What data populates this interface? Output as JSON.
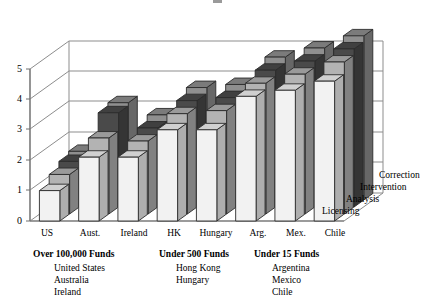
{
  "chart_data": {
    "type": "bar",
    "title": "",
    "xlabel": "",
    "ylabel": "",
    "ylim": [
      0,
      5
    ],
    "yticks": [
      "0",
      "1",
      "2",
      "3",
      "4",
      "5"
    ],
    "grid": true,
    "legend_position": "depth-axis-right",
    "projection": "3d-grouped",
    "categories": [
      "US",
      "Aust.",
      "Ireland",
      "HK",
      "Hungary",
      "Arg.",
      "Mex.",
      "Chile"
    ],
    "series": [
      {
        "name": "Licensing",
        "color": "#f2f2f2",
        "values": [
          1.0,
          2.1,
          2.1,
          3.0,
          3.0,
          4.1,
          4.3,
          4.6
        ]
      },
      {
        "name": "Analysis",
        "color": "#b3b3b3",
        "values": [
          1.3,
          2.5,
          2.4,
          3.3,
          3.4,
          4.3,
          4.6,
          5.0
        ]
      },
      {
        "name": "Intervention",
        "color": "#4a4a4a",
        "values": [
          1.5,
          3.1,
          2.6,
          3.5,
          3.6,
          4.5,
          4.8,
          5.2
        ]
      },
      {
        "name": "Correction",
        "color": "#8f8f8f",
        "values": [
          1.6,
          3.2,
          2.8,
          3.7,
          3.8,
          4.7,
          5.0,
          5.4
        ]
      }
    ],
    "depth_axis_labels": [
      "Licensing",
      "Analysis",
      "Intervention",
      "Correction"
    ]
  },
  "groups": [
    {
      "title": "Over 100,000 Funds",
      "items": [
        "United States",
        "Australia",
        "Ireland"
      ]
    },
    {
      "title": "Under 500 Funds",
      "items": [
        "Hong Kong",
        "Hungary"
      ]
    },
    {
      "title": "Under 15 Funds",
      "items": [
        "Argentina",
        "Mexico",
        "Chile"
      ]
    }
  ],
  "colors": {
    "axis": "#7a7a7a",
    "grid": "#8d8d8d",
    "outline": "#2b2b2b",
    "background": "#ffffff"
  }
}
